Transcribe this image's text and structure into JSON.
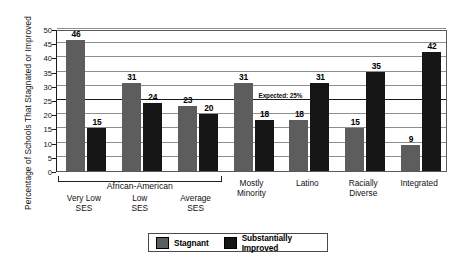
{
  "chart_data": {
    "type": "bar",
    "title": "",
    "subtitle": "",
    "xlabel": "",
    "ylabel": "Percentage of Schools That Stagnated or Improved",
    "ylim": [
      0,
      50
    ],
    "yticks": [
      0,
      5,
      10,
      15,
      20,
      25,
      30,
      35,
      40,
      45,
      50
    ],
    "grid": true,
    "legend_position": "bottom",
    "categories": [
      "Very Low\nSES",
      "Low\nSES",
      "Average\nSES",
      "Mostly\nMinority",
      "Latino",
      "Racially\nDiverse",
      "Integrated"
    ],
    "series": [
      {
        "name": "Stagnant",
        "color": "#5d5d5d",
        "values": [
          46,
          31,
          23,
          31,
          18,
          15,
          9
        ]
      },
      {
        "name": "Substantially Improved",
        "color": "#161616",
        "values": [
          15,
          24,
          20,
          18,
          31,
          35,
          42
        ]
      }
    ],
    "annotations": [
      {
        "text": "Expected: 25%",
        "value": 25,
        "kind": "reference-line-label"
      }
    ],
    "group_bracket": {
      "label": "African-American",
      "spans_categories": [
        "Very Low\nSES",
        "Low\nSES",
        "Average\nSES"
      ]
    }
  },
  "legend": {
    "items": [
      {
        "label": "Stagnant",
        "color": "#5d5d5d"
      },
      {
        "label": "Substantially Improved",
        "color": "#161616"
      }
    ]
  },
  "axis": {
    "y_title": "Percentage of Schools That Stagnated or Improved",
    "y_tick_labels": [
      "0",
      "5",
      "10",
      "15",
      "20",
      "25",
      "30",
      "35",
      "40",
      "45",
      "50"
    ]
  },
  "x_axis_labels": [
    "Very Low\nSES",
    "Low\nSES",
    "Average\nSES",
    "Mostly\nMinority",
    "Latino",
    "Racially\nDiverse",
    "Integrated"
  ],
  "bracket": {
    "label": "African-American"
  },
  "expected_line": {
    "label": "Expected: 25%"
  }
}
